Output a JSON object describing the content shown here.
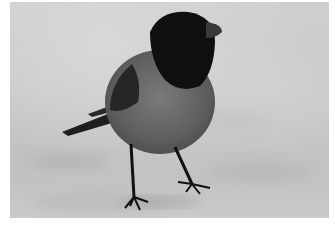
{
  "image": {
    "subject": "bird standing on ground",
    "description": "Black-and-white photo of a small bird with a dark head and bib, grey body, dark wing and tail, standing on a sandy/snowy surface",
    "colors": {
      "background": "#c8c8c8",
      "head": "#111111",
      "body": "#6e6e6e",
      "wing": "#2a2a2a",
      "border": "#ffffff"
    }
  }
}
